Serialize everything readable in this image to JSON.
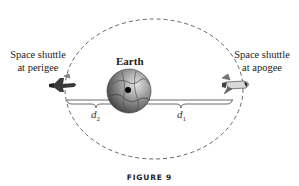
{
  "figure": {
    "caption": "FIGURE 9",
    "earth_label": "Earth",
    "perigee_label": {
      "line1": "Space shuttle",
      "line2": "at perigee"
    },
    "apogee_label": {
      "line1": "Space shuttle",
      "line2": "at apogee"
    },
    "distance_labels": {
      "d2": {
        "symbol": "d",
        "subscript": "2"
      },
      "d1": {
        "symbol": "d",
        "subscript": "1"
      }
    },
    "icons": [
      "earth-globe-icon",
      "space-shuttle-icon-perigee",
      "space-shuttle-icon-apogee"
    ],
    "colors": {
      "orbit": "#555555",
      "earth_light": "#bfbfbf",
      "earth_dark": "#4a4a4a",
      "text": "#222222"
    }
  }
}
